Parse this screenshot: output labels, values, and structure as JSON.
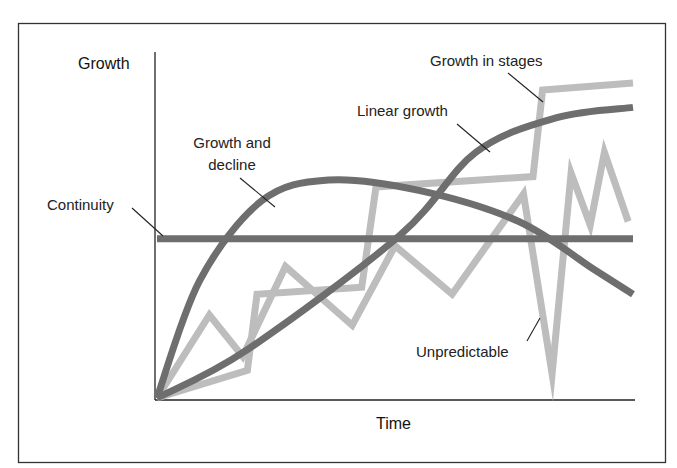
{
  "chart_data": {
    "type": "line",
    "title": "",
    "xlabel": "Time",
    "ylabel": "Growth",
    "grid": false,
    "axis_ticks": false,
    "legend": "inline annotations with leader lines",
    "x_range": [
      0,
      100
    ],
    "y_range": [
      0,
      100
    ],
    "series": [
      {
        "name": "Continuity",
        "color": "#6e6e6e",
        "style": "straight",
        "points": [
          [
            0,
            46
          ],
          [
            100,
            46
          ]
        ]
      },
      {
        "name": "Growth and decline",
        "color": "#6e6e6e",
        "style": "smooth",
        "points": [
          [
            0,
            0
          ],
          [
            9,
            34
          ],
          [
            22,
            57
          ],
          [
            36,
            63
          ],
          [
            55,
            60
          ],
          [
            76,
            51
          ],
          [
            92,
            37
          ],
          [
            100,
            30
          ]
        ]
      },
      {
        "name": "Linear growth",
        "color": "#6e6e6e",
        "style": "smooth",
        "points": [
          [
            0,
            0
          ],
          [
            19,
            14
          ],
          [
            51,
            47
          ],
          [
            67,
            71
          ],
          [
            84,
            81
          ],
          [
            100,
            84
          ]
        ]
      },
      {
        "name": "Growth in stages",
        "color": "#bdbdbd",
        "style": "straight",
        "points": [
          [
            0,
            0
          ],
          [
            19,
            8
          ],
          [
            21,
            30
          ],
          [
            43,
            32
          ],
          [
            46,
            61
          ],
          [
            79,
            64
          ],
          [
            81,
            89
          ],
          [
            100,
            91
          ]
        ]
      },
      {
        "name": "Unpredictable",
        "color": "#bdbdbd",
        "style": "straight",
        "points": [
          [
            0,
            0
          ],
          [
            11,
            24
          ],
          [
            18,
            12
          ],
          [
            27,
            38
          ],
          [
            41,
            21
          ],
          [
            50,
            44
          ],
          [
            62,
            30
          ],
          [
            77,
            59
          ],
          [
            83,
            7
          ],
          [
            87,
            65
          ],
          [
            91,
            50
          ],
          [
            94,
            71
          ],
          [
            99,
            51
          ]
        ]
      }
    ]
  },
  "labels": {
    "y_axis": "Growth",
    "x_axis": "Time",
    "continuity": "Continuity",
    "growth_and_decline_line1": "Growth and",
    "growth_and_decline_line2": "decline",
    "linear_growth": "Linear growth",
    "growth_in_stages": "Growth in stages",
    "unpredictable": "Unpredictable"
  }
}
